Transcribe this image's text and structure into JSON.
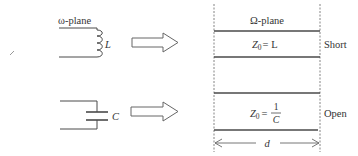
{
  "diagram": {
    "colors": {
      "line": "#4a4a4a",
      "dashed": "#777777",
      "text": "#333333",
      "arrow_outline": "#666666"
    },
    "omega_plane_label": "ω-plane",
    "Omega_plane_label": "Ω-plane",
    "inductor": {
      "symbol": "L",
      "equation_lhs": "Z",
      "equation_sub": "0",
      "equation_rhs": "= L",
      "termination": "Short"
    },
    "capacitor": {
      "symbol": "C",
      "equation_lhs": "Z",
      "equation_sub": "0",
      "equation_eq": "=",
      "equation_num": "1",
      "equation_den": "C",
      "termination": "Open"
    },
    "length_label": "d"
  }
}
